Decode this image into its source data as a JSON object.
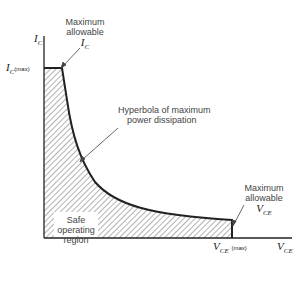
{
  "diagram": {
    "axes": {
      "y_label": {
        "main": "I",
        "sub": "C"
      },
      "x_label": {
        "main": "V",
        "sub": "CE"
      },
      "y_max_label": {
        "main": "I",
        "sub": "C",
        "suffix": "(max)"
      },
      "x_max_label": {
        "main": "V",
        "sub": "CE",
        "suffix": "(max)"
      }
    },
    "annotations": {
      "max_ic": {
        "line1": "Maximum",
        "line2": "allowable",
        "var_main": "I",
        "var_sub": "C"
      },
      "hyperbola": {
        "line1": "Hyperbola of maximum",
        "line2": "power dissipation"
      },
      "max_vce": {
        "line1": "Maximum",
        "line2": "allowable",
        "var_main": "V",
        "var_sub": "CE"
      },
      "region": {
        "line1": "Safe",
        "line2": "operating",
        "line3": "region"
      }
    },
    "colors": {
      "line": "#222222",
      "hatch": "#555555",
      "text": "#444444"
    }
  }
}
